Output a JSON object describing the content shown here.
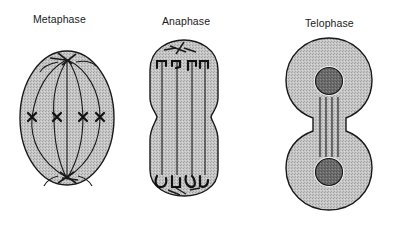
{
  "figure": {
    "colors": {
      "background": "#ffffff",
      "cytoplasm": "#c4c4c4",
      "outline": "#1a1a1a",
      "nucleus": "#6a6a6a",
      "spindle": "#1a1a1a"
    },
    "panels": [
      {
        "id": "metaphase",
        "label": "Metaphase"
      },
      {
        "id": "anaphase",
        "label": "Anaphase"
      },
      {
        "id": "telophase",
        "label": "Telophase"
      }
    ]
  }
}
